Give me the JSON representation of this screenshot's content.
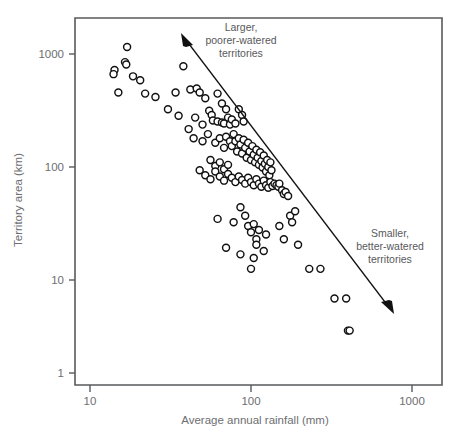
{
  "chart_data": {
    "type": "scatter",
    "title": "",
    "subtitle": "",
    "xlabel": "Average annual rainfall (mm)",
    "ylabel": "Territory area (km)",
    "xscale": "log",
    "yscale": "log",
    "xlim": [
      7.5,
      1300
    ],
    "ylim": [
      0.8,
      1600
    ],
    "grid": false,
    "legend": null,
    "xticks": [
      10,
      100,
      1000
    ],
    "xtick_labels": [
      "10",
      "100",
      "1000"
    ],
    "yticks": [
      1,
      10,
      100,
      1000
    ],
    "ytick_labels": [
      "1",
      "10",
      "100",
      "1000"
    ],
    "marker_style": {
      "shape": "open-circle",
      "fill": "#ffffff",
      "edge": "#111111",
      "diameter_px": 7
    },
    "annotations": [
      {
        "name": "upper-annotation",
        "lines": [
          "Larger,",
          "poorer-watered",
          "territories"
        ],
        "x_px": 240,
        "y_px": 30
      },
      {
        "name": "lower-annotation",
        "lines": [
          "Smaller,",
          "better-watered",
          "territories"
        ],
        "x_px": 390,
        "y_px": 235
      }
    ],
    "arrow": {
      "type": "double-headed-diagonal",
      "from_px": [
        182,
        36
      ],
      "to_px": [
        392,
        311
      ]
    },
    "points": [
      [
        17,
        1150
      ],
      [
        16.5,
        830
      ],
      [
        16.8,
        790
      ],
      [
        14.2,
        700
      ],
      [
        14.0,
        640
      ],
      [
        18.5,
        610
      ],
      [
        20.5,
        560
      ],
      [
        15.0,
        430
      ],
      [
        22.0,
        420
      ],
      [
        25.5,
        390
      ],
      [
        38.0,
        760
      ],
      [
        34.0,
        430
      ],
      [
        42.0,
        460
      ],
      [
        46.0,
        470
      ],
      [
        48.0,
        430
      ],
      [
        30.5,
        300
      ],
      [
        35.5,
        260
      ],
      [
        52.0,
        380
      ],
      [
        55.0,
        290
      ],
      [
        57.0,
        265
      ],
      [
        62.0,
        420
      ],
      [
        66.0,
        340
      ],
      [
        70.0,
        300
      ],
      [
        41.0,
        195
      ],
      [
        45.0,
        250
      ],
      [
        50.0,
        215
      ],
      [
        58.0,
        235
      ],
      [
        62.0,
        230
      ],
      [
        66.0,
        225
      ],
      [
        68.0,
        220
      ],
      [
        72.0,
        250
      ],
      [
        74.0,
        215
      ],
      [
        76.0,
        240
      ],
      [
        80.0,
        220
      ],
      [
        84.0,
        300
      ],
      [
        88.0,
        265
      ],
      [
        90.0,
        230
      ],
      [
        44.0,
        160
      ],
      [
        50.0,
        150
      ],
      [
        54.0,
        175
      ],
      [
        60.0,
        145
      ],
      [
        64.0,
        160
      ],
      [
        68.0,
        130
      ],
      [
        70.0,
        165
      ],
      [
        74.0,
        150
      ],
      [
        76.0,
        135
      ],
      [
        78.0,
        175
      ],
      [
        80.0,
        150
      ],
      [
        82.0,
        120
      ],
      [
        84.0,
        160
      ],
      [
        86.0,
        140
      ],
      [
        88.0,
        115
      ],
      [
        90.0,
        155
      ],
      [
        92.0,
        130
      ],
      [
        94.0,
        105
      ],
      [
        96.0,
        145
      ],
      [
        98.0,
        120
      ],
      [
        100.0,
        100
      ],
      [
        102.0,
        135
      ],
      [
        104.0,
        112
      ],
      [
        106.0,
        95
      ],
      [
        108.0,
        125
      ],
      [
        110.0,
        105
      ],
      [
        112.0,
        90
      ],
      [
        114.0,
        118
      ],
      [
        116.0,
        98
      ],
      [
        118.0,
        85
      ],
      [
        120.0,
        110
      ],
      [
        122.0,
        92
      ],
      [
        124.0,
        78
      ],
      [
        126.0,
        100
      ],
      [
        128.0,
        86
      ],
      [
        130.0,
        72
      ],
      [
        132.0,
        95
      ],
      [
        134.0,
        80
      ],
      [
        56.0,
        100
      ],
      [
        60.0,
        88
      ],
      [
        64.0,
        95
      ],
      [
        68.0,
        82
      ],
      [
        72.0,
        90
      ],
      [
        48.0,
        80
      ],
      [
        52.0,
        72
      ],
      [
        56.0,
        66
      ],
      [
        60.0,
        78
      ],
      [
        64.0,
        70
      ],
      [
        68.0,
        64
      ],
      [
        72.0,
        74
      ],
      [
        76.0,
        68
      ],
      [
        80.0,
        62
      ],
      [
        84.0,
        70
      ],
      [
        88.0,
        65
      ],
      [
        92.0,
        60
      ],
      [
        96.0,
        68
      ],
      [
        100.0,
        62
      ],
      [
        104.0,
        58
      ],
      [
        108.0,
        66
      ],
      [
        112.0,
        60
      ],
      [
        116.0,
        56
      ],
      [
        120.0,
        64
      ],
      [
        124.0,
        58
      ],
      [
        128.0,
        55
      ],
      [
        132.0,
        62
      ],
      [
        136.0,
        57
      ],
      [
        140.0,
        60
      ],
      [
        144.0,
        58
      ],
      [
        148.0,
        56
      ],
      [
        150.0,
        60
      ],
      [
        156.0,
        52
      ],
      [
        160.0,
        48
      ],
      [
        164.0,
        50
      ],
      [
        170.0,
        46
      ],
      [
        175.0,
        30
      ],
      [
        180.0,
        26
      ],
      [
        62.0,
        28
      ],
      [
        78.0,
        26
      ],
      [
        86.0,
        36
      ],
      [
        92.0,
        30
      ],
      [
        96.0,
        24
      ],
      [
        100.0,
        21
      ],
      [
        104.0,
        25
      ],
      [
        108.0,
        18
      ],
      [
        112.0,
        22
      ],
      [
        120.0,
        14
      ],
      [
        124.0,
        20
      ],
      [
        70.0,
        15
      ],
      [
        86.0,
        13
      ],
      [
        104.0,
        12
      ],
      [
        108.0,
        16
      ],
      [
        100.0,
        9.5
      ],
      [
        150.0,
        24
      ],
      [
        160.0,
        18
      ],
      [
        188.0,
        33
      ],
      [
        196.0,
        16
      ],
      [
        230.0,
        9.5
      ],
      [
        270.0,
        9.5
      ],
      [
        330.0,
        5.0
      ],
      [
        390.0,
        5.0
      ],
      [
        400.0,
        2.5
      ],
      [
        410.0,
        2.5
      ]
    ]
  },
  "axes": {
    "x_title": "Average annual rainfall (mm)",
    "y_title": "Territory area (km)"
  },
  "ticks": {
    "x": [
      "10",
      "100",
      "1000"
    ],
    "y": [
      "1000",
      "100",
      "10",
      "1"
    ]
  },
  "annotation_upper": {
    "line1": "Larger,",
    "line2": "poorer-watered",
    "line3": "territories"
  },
  "annotation_lower": {
    "line1": "Smaller,",
    "line2": "better-watered",
    "line3": "territories"
  },
  "colors": {
    "axis": "#58595b",
    "marker_edge": "#111111",
    "marker_fill": "#ffffff",
    "text": "#6d6e71",
    "annotation_text": "#58595b"
  }
}
